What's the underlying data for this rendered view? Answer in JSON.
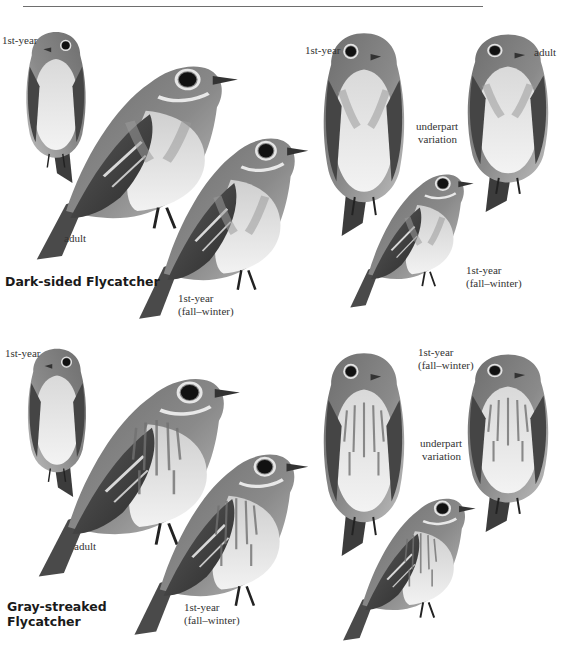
{
  "page": {
    "colors": {
      "background": "#ffffff",
      "rule": "#6e6e6e",
      "label_text": "#333333",
      "species_text": "#1a1a1a"
    }
  },
  "plates": [
    {
      "species": "Dark-sided Flycatcher",
      "species_lines": [
        "Dark-sided Flycatcher"
      ],
      "labels": {
        "small_first_year": "1st-year",
        "adult": "adult",
        "first_year_fall_line1": "1st-year",
        "first_year_fall_line2": "(fall–winter)",
        "right_first_year": "1st-year",
        "right_adult": "adult",
        "underpart_line1": "underpart",
        "underpart_line2": "variation",
        "right_first_year_fall_line1": "1st-year",
        "right_first_year_fall_line2": "(fall–winter)"
      }
    },
    {
      "species": "Gray-streaked Flycatcher",
      "species_lines": [
        "Gray-streaked",
        "Flycatcher"
      ],
      "labels": {
        "small_first_year": "1st-year",
        "adult": "adult",
        "first_year_fall_line1": "1st-year",
        "first_year_fall_line2": "(fall–winter)",
        "right_first_year_fall_line1": "1st-year",
        "right_first_year_fall_line2": "(fall–winter)",
        "underpart_line1": "underpart",
        "underpart_line2": "variation"
      }
    }
  ],
  "illustrations": [
    "bird-dark-sided-1st-year-small",
    "bird-dark-sided-adult",
    "bird-dark-sided-1st-year-fall",
    "bird-dark-sided-front-1st-year",
    "bird-dark-sided-front-adult",
    "bird-dark-sided-front-1st-year-fall",
    "bird-gray-streaked-1st-year-small",
    "bird-gray-streaked-adult",
    "bird-gray-streaked-1st-year-fall",
    "bird-gray-streaked-front-1st-year",
    "bird-gray-streaked-front-adult",
    "bird-gray-streaked-front-1st-year-fall"
  ]
}
